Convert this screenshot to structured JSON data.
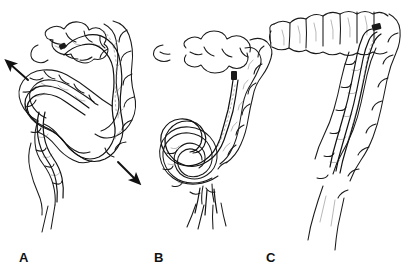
{
  "figure": {
    "background_color": "#ffffff",
    "ink_color": "#1a1a1a",
    "shading_color": "#8a8a8a",
    "width": 410,
    "height": 273
  },
  "panels": [
    {
      "id": "A",
      "label": "A",
      "caption": "Sigmoid loop with colonoscope advanced into transverse colon",
      "anatomy": [
        "transverse-colon",
        "splenic-flexure",
        "descending-colon",
        "sigmoid-colon",
        "rectum"
      ],
      "scope_state": "looped",
      "scope_tip_location": "transverse-colon",
      "arrows": [
        {
          "id": "arrow-stretch-superior",
          "direction": "up-left",
          "meaning": "bowel stretched outward by loop",
          "x": 22,
          "y": 72,
          "angle_deg": -135
        },
        {
          "id": "arrow-stretch-inferior",
          "direction": "down-right",
          "meaning": "bowel stretched outward by loop",
          "x": 128,
          "y": 172,
          "angle_deg": 45
        }
      ]
    },
    {
      "id": "B",
      "label": "B",
      "caption": "Alpha loop formed in sigmoid colon; scope tip in descending colon",
      "anatomy": [
        "transverse-colon",
        "splenic-flexure",
        "descending-colon",
        "sigmoid-alpha-loop",
        "rectum"
      ],
      "scope_state": "alpha-loop",
      "scope_tip_location": "descending-colon",
      "arrows": []
    },
    {
      "id": "C",
      "label": "C",
      "caption": "Loop reduced; colonoscope straightened along descending colon",
      "anatomy": [
        "transverse-colon",
        "splenic-flexure",
        "descending-colon",
        "rectum"
      ],
      "scope_state": "straightened",
      "scope_tip_location": "splenic-flexure",
      "arrows": []
    }
  ]
}
